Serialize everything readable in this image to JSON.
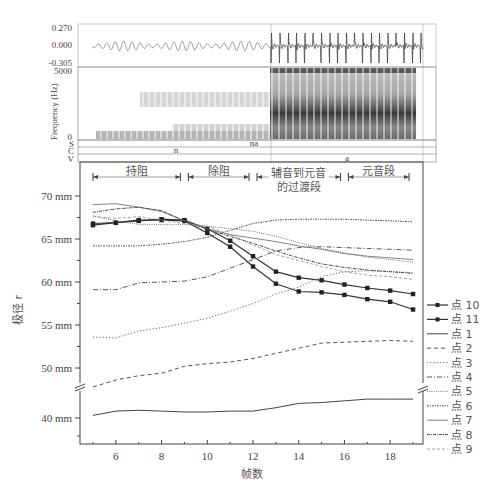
{
  "figure": {
    "waveform": {
      "y_ticks": [
        "0.270",
        "0.000",
        "-0.305"
      ]
    },
    "spectrogram": {
      "ylabel": "Frequency (Hz)",
      "y_ticks": [
        "5000",
        "0"
      ]
    },
    "tiers": [
      {
        "label": "S",
        "segments": [
          "na"
        ]
      },
      {
        "label": "C",
        "segments": [
          "n"
        ]
      },
      {
        "label": "V",
        "segments": [
          "a"
        ]
      }
    ]
  },
  "chart_data": {
    "type": "line",
    "title": "",
    "xlabel": "帧数",
    "ylabel": "极径 r",
    "xlim": [
      5,
      19
    ],
    "x_ticks": [
      6,
      8,
      10,
      12,
      14,
      16,
      18
    ],
    "y_ticks": [
      "70 mm",
      "65 mm",
      "60 mm",
      "55 mm",
      "50 mm",
      "40 mm"
    ],
    "y_axis_break": [
      45,
      49
    ],
    "grid": false,
    "legend_position": "right",
    "phases": [
      {
        "label": "持阻",
        "from": 5,
        "to": 9
      },
      {
        "label": "除阻",
        "from": 9,
        "to": 12
      },
      {
        "label": "辅音到元音\n的过渡段",
        "label_line1": "辅音到元音",
        "label_line2": "的过渡段",
        "from": 12,
        "to": 16
      },
      {
        "label": "元音段",
        "from": 16,
        "to": 19
      }
    ],
    "x": [
      5,
      6,
      7,
      8,
      9,
      10,
      11,
      12,
      13,
      14,
      15,
      16,
      17,
      18,
      19
    ],
    "series": [
      {
        "name": "点 10",
        "style": "solid-marker",
        "values": [
          66.8,
          66.9,
          67.1,
          67.3,
          67.2,
          66.2,
          64.8,
          63.0,
          61.2,
          60.5,
          60.2,
          59.7,
          59.3,
          59.0,
          58.6
        ]
      },
      {
        "name": "点 11",
        "style": "solid-marker",
        "values": [
          66.6,
          66.9,
          67.2,
          67.2,
          67.1,
          65.7,
          64.1,
          61.8,
          59.8,
          58.9,
          58.8,
          58.5,
          58.0,
          57.7,
          56.8
        ]
      },
      {
        "name": "点 1",
        "style": "solid",
        "values": [
          40.3,
          40.8,
          40.9,
          40.8,
          40.7,
          40.7,
          40.8,
          40.8,
          41.2,
          41.7,
          41.8,
          42.0,
          42.2,
          42.2,
          42.2
        ]
      },
      {
        "name": "点 2",
        "style": "dashed",
        "values": [
          47.8,
          48.6,
          49.1,
          49.4,
          50.2,
          50.5,
          50.7,
          51.1,
          51.7,
          52.3,
          52.9,
          53.0,
          53.1,
          53.2,
          53.1
        ]
      },
      {
        "name": "点 3",
        "style": "dotted",
        "values": [
          53.6,
          53.5,
          54.3,
          54.7,
          55.2,
          55.8,
          56.6,
          57.5,
          58.6,
          59.4,
          60.6,
          61.2,
          61.3,
          61.2,
          61.1
        ]
      },
      {
        "name": "点 4",
        "style": "dashdot",
        "values": [
          59.1,
          59.1,
          59.9,
          60.0,
          60.1,
          60.6,
          61.6,
          62.6,
          63.6,
          64.0,
          64.1,
          64.0,
          63.9,
          63.8,
          63.7
        ]
      },
      {
        "name": "点 5",
        "style": "dotted-dense",
        "values": [
          67.7,
          67.1,
          66.7,
          66.7,
          66.7,
          66.5,
          66.2,
          65.9,
          65.3,
          64.6,
          63.9,
          63.4,
          62.9,
          62.6,
          62.3
        ]
      },
      {
        "name": "点 6",
        "style": "dotted-fine",
        "values": [
          64.2,
          64.2,
          64.2,
          64.4,
          64.7,
          65.2,
          66.0,
          66.8,
          67.2,
          67.3,
          67.3,
          67.3,
          67.2,
          67.1,
          67.0
        ]
      },
      {
        "name": "点 7",
        "style": "solid-thin",
        "values": [
          69.0,
          69.1,
          68.7,
          68.2,
          67.1,
          66.2,
          65.5,
          65.1,
          64.7,
          64.2,
          63.8,
          63.3,
          63.0,
          62.8,
          62.6
        ]
      },
      {
        "name": "点 8",
        "style": "dashdot-dense",
        "values": [
          68.1,
          68.5,
          68.7,
          68.3,
          67.1,
          66.1,
          65.3,
          64.5,
          63.6,
          62.8,
          62.1,
          61.7,
          61.4,
          61.2,
          61.0
        ]
      },
      {
        "name": "点 9",
        "style": "dashed-light",
        "values": [
          67.6,
          67.4,
          67.6,
          67.2,
          66.8,
          66.5,
          65.5,
          64.3,
          63.2,
          62.5,
          61.8,
          61.2,
          60.8,
          60.6,
          60.3
        ]
      }
    ]
  }
}
